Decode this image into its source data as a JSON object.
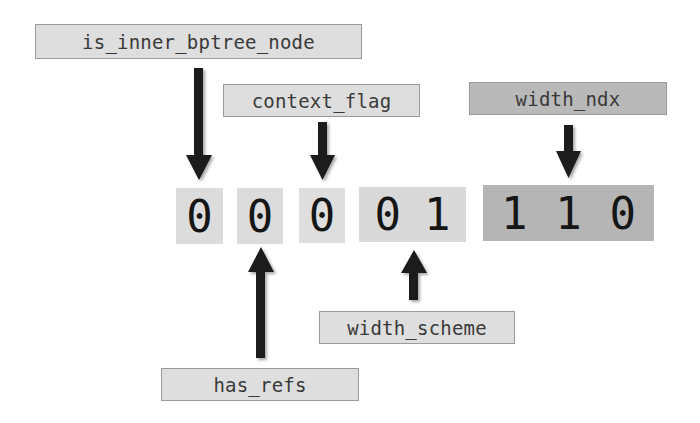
{
  "diagram": {
    "type": "bit-field header layout",
    "colors": {
      "label_light": "#dedede",
      "label_dark": "#b9b9b9",
      "bit_light": "#dcdcdc",
      "bit_mid": "#d6d6d6",
      "bit_dark": "#b3b3b3",
      "arrow": "#1a1a1a"
    },
    "fields": [
      {
        "id": "is_inner_bptree_node",
        "label": "is_inner_bptree_node",
        "bits": [
          "0"
        ],
        "arrow": "down"
      },
      {
        "id": "has_refs",
        "label": "has_refs",
        "bits": [
          "0"
        ],
        "arrow": "up"
      },
      {
        "id": "context_flag",
        "label": "context_flag",
        "bits": [
          "0"
        ],
        "arrow": "down"
      },
      {
        "id": "width_scheme",
        "label": "width_scheme",
        "bits": [
          "0",
          "1"
        ],
        "arrow": "up"
      },
      {
        "id": "width_ndx",
        "label": "width_ndx",
        "bits": [
          "1",
          "1",
          "0"
        ],
        "arrow": "down"
      }
    ]
  }
}
